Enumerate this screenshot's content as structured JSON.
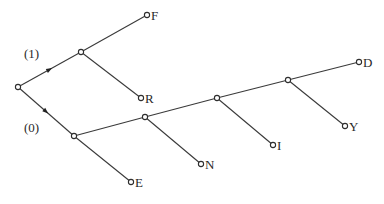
{
  "diagram": {
    "type": "tree",
    "colors": {
      "line": "#3a3a3a",
      "node_fill": "#ffffff",
      "text": "#2a2a2a"
    },
    "branch_labels": [
      {
        "id": "label-1",
        "text": "(1)",
        "x": 24,
        "y": 58
      },
      {
        "id": "label-0",
        "text": "(0)",
        "x": 24,
        "y": 132
      }
    ],
    "nodes": [
      {
        "id": "root",
        "x": 18,
        "y": 87,
        "label": ""
      },
      {
        "id": "n1",
        "x": 81,
        "y": 52,
        "label": ""
      },
      {
        "id": "F",
        "x": 147,
        "y": 15,
        "label": "F"
      },
      {
        "id": "R",
        "x": 141,
        "y": 98,
        "label": "R"
      },
      {
        "id": "n0",
        "x": 74,
        "y": 136,
        "label": ""
      },
      {
        "id": "E",
        "x": 131,
        "y": 182,
        "label": "E"
      },
      {
        "id": "a",
        "x": 145,
        "y": 117,
        "label": ""
      },
      {
        "id": "N",
        "x": 201,
        "y": 164,
        "label": "N"
      },
      {
        "id": "b",
        "x": 217,
        "y": 98,
        "label": ""
      },
      {
        "id": "I",
        "x": 273,
        "y": 145,
        "label": "I"
      },
      {
        "id": "c",
        "x": 288,
        "y": 80,
        "label": ""
      },
      {
        "id": "Y",
        "x": 345,
        "y": 126,
        "label": "Y"
      },
      {
        "id": "D",
        "x": 359,
        "y": 62,
        "label": "D"
      }
    ],
    "edges": [
      {
        "from": "root",
        "to": "n1",
        "arrow": true
      },
      {
        "from": "n1",
        "to": "F"
      },
      {
        "from": "n1",
        "to": "R"
      },
      {
        "from": "root",
        "to": "n0",
        "arrow": true
      },
      {
        "from": "n0",
        "to": "E"
      },
      {
        "from": "n0",
        "to": "a"
      },
      {
        "from": "a",
        "to": "N"
      },
      {
        "from": "a",
        "to": "b"
      },
      {
        "from": "b",
        "to": "I"
      },
      {
        "from": "b",
        "to": "c"
      },
      {
        "from": "c",
        "to": "Y"
      },
      {
        "from": "c",
        "to": "D"
      }
    ],
    "leaf_labels": [
      "F",
      "R",
      "E",
      "N",
      "I",
      "Y",
      "D"
    ]
  }
}
